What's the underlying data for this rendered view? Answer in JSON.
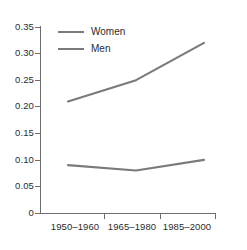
{
  "chart_data": {
    "type": "line",
    "title": "",
    "xlabel": "",
    "ylabel": "",
    "categories": [
      "1950–1960",
      "1965–1980",
      "1985–2000"
    ],
    "series": [
      {
        "name": "Women",
        "values": [
          0.21,
          0.25,
          0.32
        ],
        "color": "#7a7a7a"
      },
      {
        "name": "Men",
        "values": [
          0.09,
          0.08,
          0.1
        ],
        "color": "#7a7a7a"
      }
    ],
    "ylim": [
      0,
      0.35
    ],
    "yticks": [
      0,
      0.05,
      0.1,
      0.15,
      0.2,
      0.25,
      0.3,
      0.35
    ],
    "ytick_labels": [
      "0",
      "0.05",
      "0.10",
      "0.15",
      "0.20",
      "0.25",
      "0.30",
      "0.35"
    ],
    "grid": false,
    "legend_position": "top-left-inside"
  },
  "axes": {
    "y_labels": [
      "0.35",
      "0.30",
      "0.25",
      "0.20",
      "0.15",
      "0.10",
      "0.05",
      "0"
    ],
    "x_labels": [
      "1950–1960",
      "1965–1980",
      "1985–2000"
    ]
  },
  "legend": {
    "items": [
      {
        "label": "Women"
      },
      {
        "label": "Men"
      }
    ]
  },
  "caption": {
    "fragment": ""
  },
  "colors": {
    "series_line": "#7a7a7a",
    "axis": "#6e6e6e",
    "text": "#2b2b2b",
    "background": "#ffffff"
  }
}
